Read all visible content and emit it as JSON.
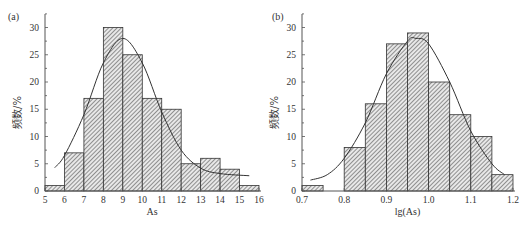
{
  "chart_data": [
    {
      "type": "bar",
      "panel_label": "(a)",
      "title": "",
      "xlabel": "As",
      "ylabel": "频数/%",
      "xlim": [
        5,
        16
      ],
      "ylim": [
        0,
        32
      ],
      "xticks": [
        5,
        6,
        7,
        8,
        9,
        10,
        11,
        12,
        13,
        14,
        15,
        16
      ],
      "yticks": [
        0,
        5,
        10,
        15,
        20,
        25,
        30
      ],
      "bin_edges": [
        5,
        6,
        7,
        8,
        9,
        10,
        11,
        12,
        13,
        14,
        15,
        16
      ],
      "values": [
        1,
        7,
        17,
        30,
        25,
        17,
        15,
        5,
        6,
        4,
        1
      ],
      "fit_curve": {
        "type": "line",
        "points": [
          [
            5.5,
            4.3
          ],
          [
            6,
            6.5
          ],
          [
            7,
            14
          ],
          [
            8,
            23.5
          ],
          [
            9,
            28
          ],
          [
            10,
            23.5
          ],
          [
            11,
            14.5
          ],
          [
            12,
            7.5
          ],
          [
            13,
            4.2
          ],
          [
            14,
            3.2
          ],
          [
            15.5,
            2.8
          ]
        ]
      },
      "grid": false,
      "legend": null
    },
    {
      "type": "bar",
      "panel_label": "(b)",
      "title": "",
      "xlabel": "lg(As)",
      "ylabel": "频数/%",
      "xlim": [
        0.7,
        1.2
      ],
      "ylim": [
        0,
        32
      ],
      "xticks": [
        0.7,
        0.8,
        0.9,
        1.0,
        1.1,
        1.2
      ],
      "yticks": [
        0,
        5,
        10,
        15,
        20,
        25,
        30
      ],
      "bin_edges": [
        0.7,
        0.75,
        0.8,
        0.85,
        0.9,
        0.95,
        1.0,
        1.05,
        1.1,
        1.15,
        1.2
      ],
      "values": [
        1,
        0,
        8,
        16,
        27,
        29,
        20,
        14,
        10,
        3
      ],
      "fit_curve": {
        "type": "line",
        "points": [
          [
            0.72,
            2
          ],
          [
            0.76,
            3
          ],
          [
            0.8,
            6
          ],
          [
            0.85,
            12.5
          ],
          [
            0.9,
            21.5
          ],
          [
            0.95,
            27.5
          ],
          [
            0.97,
            28
          ],
          [
            1.0,
            27
          ],
          [
            1.05,
            20
          ],
          [
            1.1,
            11
          ],
          [
            1.15,
            5
          ],
          [
            1.18,
            3
          ]
        ]
      },
      "grid": false,
      "legend": null
    }
  ]
}
